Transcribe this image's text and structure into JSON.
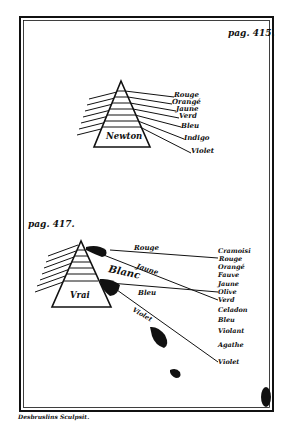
{
  "plate": {
    "ink_color": "#111111",
    "paper_color": "#ffffff",
    "engraver_signature": "Desbruslins Sculpsit."
  },
  "figure_top": {
    "page_ref": "pag. 415.",
    "prism_label": "Newton",
    "colors": [
      "Rouge",
      "Orangé",
      "Jaune",
      "Verd",
      "Bleu",
      "Indigo",
      "Violet"
    ]
  },
  "figure_bottom": {
    "page_ref": "pag. 417.",
    "prism_label": "Vrai",
    "ray_labels": {
      "rouge": "Rouge",
      "jaune": "Jaune",
      "blanc": "Blanc",
      "bleu": "Bleu",
      "violet": "Violet"
    },
    "colors": [
      "Cramoisi",
      "Rouge",
      "Orangé",
      "Fauve",
      "Jaune",
      "Olive",
      "Verd",
      "Celadon",
      "Bleu",
      "Violant",
      "Agathe",
      "Violet"
    ]
  }
}
